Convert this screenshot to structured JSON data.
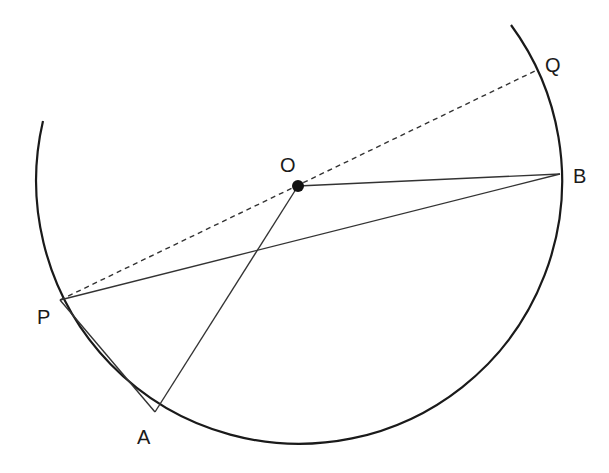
{
  "diagram": {
    "type": "circle-geometry",
    "center": {
      "label": "O",
      "x": 298,
      "y": 186
    },
    "radius": 263,
    "points": [
      {
        "label": "O",
        "x": 298,
        "y": 186,
        "label_x": 280,
        "label_y": 172
      },
      {
        "label": "B",
        "x": 560,
        "y": 174,
        "label_x": 573,
        "label_y": 183
      },
      {
        "label": "P",
        "x": 60,
        "y": 300,
        "label_x": 37,
        "label_y": 324
      },
      {
        "label": "A",
        "x": 155,
        "y": 412,
        "label_x": 137,
        "label_y": 444
      },
      {
        "label": "Q",
        "x": 537,
        "y": 70,
        "label_x": 545,
        "label_y": 70
      }
    ],
    "segments": [
      {
        "from": "O",
        "to": "B",
        "style": "solid"
      },
      {
        "from": "O",
        "to": "A",
        "style": "solid"
      },
      {
        "from": "P",
        "to": "B",
        "style": "solid"
      },
      {
        "from": "P",
        "to": "A",
        "style": "solid"
      },
      {
        "from": "P",
        "to": "Q",
        "style": "dashed"
      }
    ],
    "arc": {
      "start": {
        "x": 42,
        "y": 120
      },
      "end": {
        "x": 511,
        "y": 25
      },
      "description": "major arc of circle centered at O"
    },
    "colors": {
      "stroke": "#1a1a1a",
      "background": "#ffffff"
    }
  }
}
